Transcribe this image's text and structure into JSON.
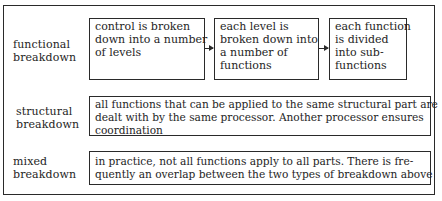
{
  "rows": [
    {
      "label": [
        "functional",
        "breakdown"
      ],
      "steps": [
        {
          "lines": [
            "control is broken",
            "down into a number",
            "of levels"
          ]
        },
        {
          "lines": [
            "each level is",
            "broken down into",
            "a number of",
            "functions"
          ]
        },
        {
          "lines": [
            "each function",
            "is divided",
            "into sub-",
            "functions"
          ]
        }
      ]
    },
    {
      "label": [
        "structural",
        "breakdown"
      ],
      "lines": [
        "all functions that can be applied to the same structural part are",
        "dealt with by the same processor. Another processor ensures",
        "coordination"
      ]
    },
    {
      "label": [
        "mixed",
        "breakdown"
      ],
      "lines": [
        "in practice, not all functions apply to all parts. There is fre-",
        "quently an overlap between the two types of breakdown above"
      ]
    }
  ],
  "colors": {
    "line": "#2a2a2a",
    "text": "#1e1e1e",
    "background": "#ffffff"
  }
}
